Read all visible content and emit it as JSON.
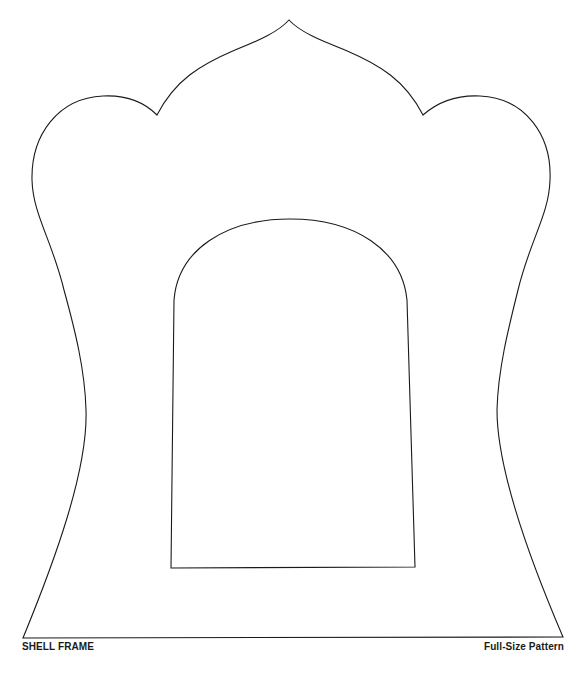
{
  "pattern": {
    "title": "SHELL FRAME",
    "subtitle": "Full-Size Pattern",
    "line_color": "#1a1a1a",
    "background_color": "#ffffff",
    "outer_outline_path": "M 289 20 C 300 32, 320 40, 345 50 C 380 65, 405 80, 423 115 C 440 100, 460 95, 480 96 C 525 98, 552 135, 550 180 C 549 215, 530 240, 518 290 C 508 330, 498 370, 497 410 C 497 470, 530 560, 563 637 L 23 638 C 55 560, 88 470, 86 410 C 85 370, 75 330, 64 290 C 52 240, 33 215, 32 180 C 31 135, 58 98, 103 96 C 123 95, 142 100, 157 115 C 175 80, 200 65, 235 50 C 260 40, 278 32, 289 20 Z",
    "inner_window_path": "M 171 568 L 174 300 C 178 250, 225 219, 290 219 C 355 219, 402 250, 407 300 L 415 567 Z"
  }
}
